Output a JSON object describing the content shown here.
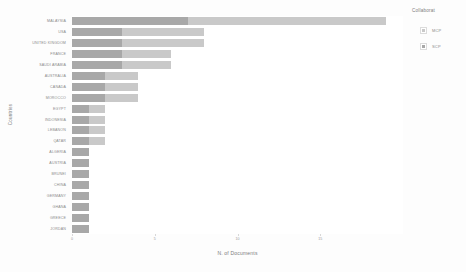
{
  "chart_data": {
    "type": "bar",
    "orientation": "horizontal",
    "stacked": true,
    "title": "",
    "xlabel": "N. of Documents",
    "ylabel": "Countries",
    "xlim": [
      0,
      20
    ],
    "xticks": [
      0,
      5,
      10,
      15
    ],
    "xticklabels": [
      "0",
      "5",
      "10",
      "15"
    ],
    "grid": false,
    "legend": {
      "title": "Collaborat",
      "position": "right",
      "entries": [
        {
          "name": "MCP",
          "color": "#c9c9c9"
        },
        {
          "name": "SCP",
          "color": "#a8a8a8"
        }
      ]
    },
    "categories": [
      "MALAYSIA",
      "USA",
      "UNITED KINGDOM",
      "FRANCE",
      "SAUDI ARABIA",
      "AUSTRALIA",
      "CANADA",
      "MOROCCO",
      "EGYPT",
      "INDONESIA",
      "LEBANON",
      "QATAR",
      "ALGERIA",
      "AUSTRIA",
      "BRUNEI",
      "CHINA",
      "GERMANY",
      "GHANA",
      "GREECE",
      "JORDAN"
    ],
    "series": [
      {
        "name": "SCP",
        "color": "#a8a8a8",
        "values": [
          7,
          3,
          3,
          3,
          3,
          2,
          2,
          2,
          1,
          1,
          1,
          1,
          1,
          1,
          1,
          1,
          1,
          1,
          1,
          1
        ]
      },
      {
        "name": "MCP",
        "color": "#c9c9c9",
        "values": [
          12,
          5,
          5,
          3,
          3,
          2,
          2,
          2,
          1,
          1,
          1,
          1,
          0,
          0,
          0,
          0,
          0,
          0,
          0,
          0
        ]
      }
    ],
    "totals": [
      19,
      8,
      8,
      6,
      6,
      4,
      4,
      4,
      2,
      2,
      2,
      2,
      1,
      1,
      1,
      1,
      1,
      1,
      1,
      1
    ]
  }
}
